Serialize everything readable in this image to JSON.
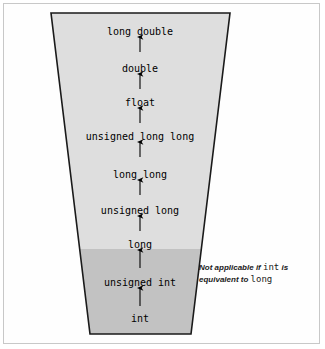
{
  "figure": {
    "shape": "trapezoid",
    "colors": {
      "upper_fill": "#dedede",
      "lower_fill": "#c2c2c2",
      "outline": "#1a1a1a",
      "frame_border": "#c8c8c8",
      "background": "#ffffff",
      "text": "#000000"
    },
    "geometry": {
      "top_left_x": 51,
      "top_right_x": 230,
      "bottom_left_x": 90,
      "bottom_right_x": 191,
      "top_y": 13,
      "bottom_y": 334,
      "shade_split_y": 249,
      "center_x": 140
    },
    "levels": [
      {
        "label": "long double",
        "y": 32,
        "arrow_from_y": 52,
        "arrow_to_y": 37,
        "has_arrow": true
      },
      {
        "label": "double",
        "y": 69,
        "arrow_from_y": 89,
        "arrow_to_y": 74,
        "has_arrow": true
      },
      {
        "label": "float",
        "y": 103,
        "arrow_from_y": 123,
        "arrow_to_y": 108,
        "has_arrow": true
      },
      {
        "label": "unsigned long long",
        "y": 137,
        "arrow_from_y": 157,
        "arrow_to_y": 142,
        "has_arrow": true
      },
      {
        "label": "long long",
        "y": 175,
        "arrow_from_y": 195,
        "arrow_to_y": 180,
        "has_arrow": true
      },
      {
        "label": "unsigned long",
        "y": 211,
        "arrow_from_y": 231,
        "arrow_to_y": 216,
        "has_arrow": true
      },
      {
        "label": "long",
        "y": 245,
        "arrow_from_y": 268,
        "arrow_to_y": 250,
        "has_arrow": true
      },
      {
        "label": "unsigned int",
        "y": 283,
        "arrow_from_y": 306,
        "arrow_to_y": 288,
        "has_arrow": true
      },
      {
        "label": "int",
        "y": 319,
        "arrow_from_y": null,
        "arrow_to_y": null,
        "has_arrow": false
      }
    ],
    "annotation": {
      "line1_pre": "Not applicable if ",
      "line1_code": "int",
      "line1_post": " is",
      "line2_pre": "equivalent to ",
      "line2_code": "long",
      "full_text": "Not applicable if int is equivalent to long"
    }
  }
}
